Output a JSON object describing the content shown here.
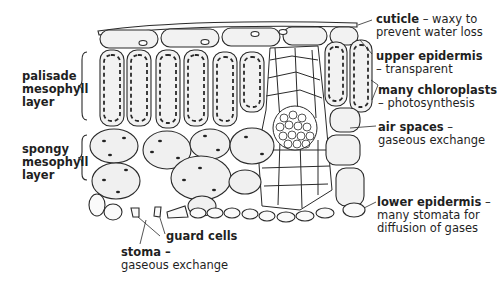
{
  "diagram": {
    "left_labels": {
      "palisade": [
        "palisade",
        "mesophyll",
        "layer"
      ],
      "spongy": [
        "spongy",
        "mesophyll",
        "layer"
      ]
    },
    "right_labels": [
      {
        "term": "cuticle",
        "sep": " – ",
        "desc": "waxy to",
        "desc2": "prevent water loss"
      },
      {
        "term": "upper epidermis",
        "sep": "",
        "desc": "",
        "desc2": "– transparent"
      },
      {
        "term": "many chloroplasts",
        "sep": "",
        "desc": "",
        "desc2": "– photosynthesis"
      },
      {
        "term": "air spaces",
        "sep": " –",
        "desc": "",
        "desc2": "gaseous exchange"
      },
      {
        "term": "lower epidermis",
        "sep": " –",
        "desc": "",
        "desc2": "many stomata for",
        "desc3": "diffusion of gases"
      }
    ],
    "bottom_labels": {
      "guard_cells": "guard cells",
      "stoma_term": "stoma –",
      "stoma_desc": "gaseous exchange"
    },
    "colors": {
      "outline": "#2a2a2a",
      "cell_fill": "#f0f0f0",
      "background": "#ffffff"
    }
  }
}
